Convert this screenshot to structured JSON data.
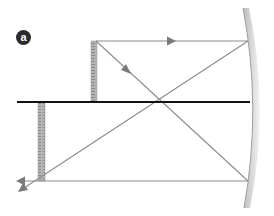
{
  "figure": {
    "label": "a",
    "colors": {
      "ray": "#8c8c8c",
      "axis": "#111111",
      "ruler": "#a9a9a9",
      "mirror": "#c9c9c9",
      "badge": "#2b2b2b"
    }
  },
  "elements": {
    "optical_axis": {
      "x1": 17,
      "y1": 102,
      "x2": 250,
      "y2": 102
    },
    "object_ruler": {
      "x": 91,
      "y": 41,
      "width": 6,
      "height": 60
    },
    "image_ruler": {
      "x": 38,
      "y": 103,
      "width": 7,
      "height": 78
    },
    "mirror": {
      "top": [
        243,
        8
      ],
      "bottom": [
        244,
        208
      ],
      "bulge_x": 258
    },
    "rays": [
      {
        "name": "parallel-ray-top",
        "from": [
          96,
          41
        ],
        "to": [
          248,
          41
        ],
        "arrow_at": [
          172,
          41
        ],
        "direction": "right"
      },
      {
        "name": "focal-ray-down",
        "from": [
          96,
          41
        ],
        "to": [
          248,
          181
        ],
        "arrow_at": [
          128,
          71
        ],
        "direction": "down-right"
      },
      {
        "name": "reflected-parallel-bottom",
        "from": [
          248,
          181
        ],
        "to": [
          18,
          181
        ],
        "arrow_at": [
          18,
          181
        ],
        "direction": "left"
      },
      {
        "name": "reflected-through-focus",
        "from": [
          248,
          41
        ],
        "to": [
          20,
          191
        ],
        "arrow_at": [
          20,
          191
        ],
        "direction": "down-left"
      }
    ]
  }
}
